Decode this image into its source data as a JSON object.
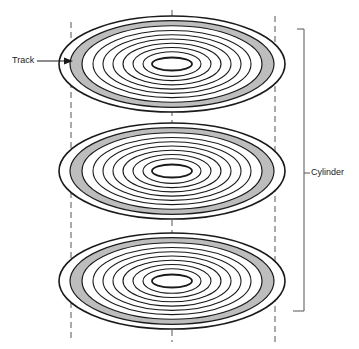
{
  "diagram": {
    "labels": {
      "track": "Track",
      "cylinder": "Cylinder"
    },
    "platters": [
      {
        "name": "top-platter",
        "cx": 172,
        "cy": 64
      },
      {
        "name": "middle-platter",
        "cx": 172,
        "cy": 171
      },
      {
        "name": "bottom-platter",
        "cx": 172,
        "cy": 281
      }
    ],
    "colors": {
      "stroke": "#1a1a1a",
      "track_fill": "#bdbdbd",
      "dashed": "#555555",
      "bracket": "#555555"
    }
  }
}
